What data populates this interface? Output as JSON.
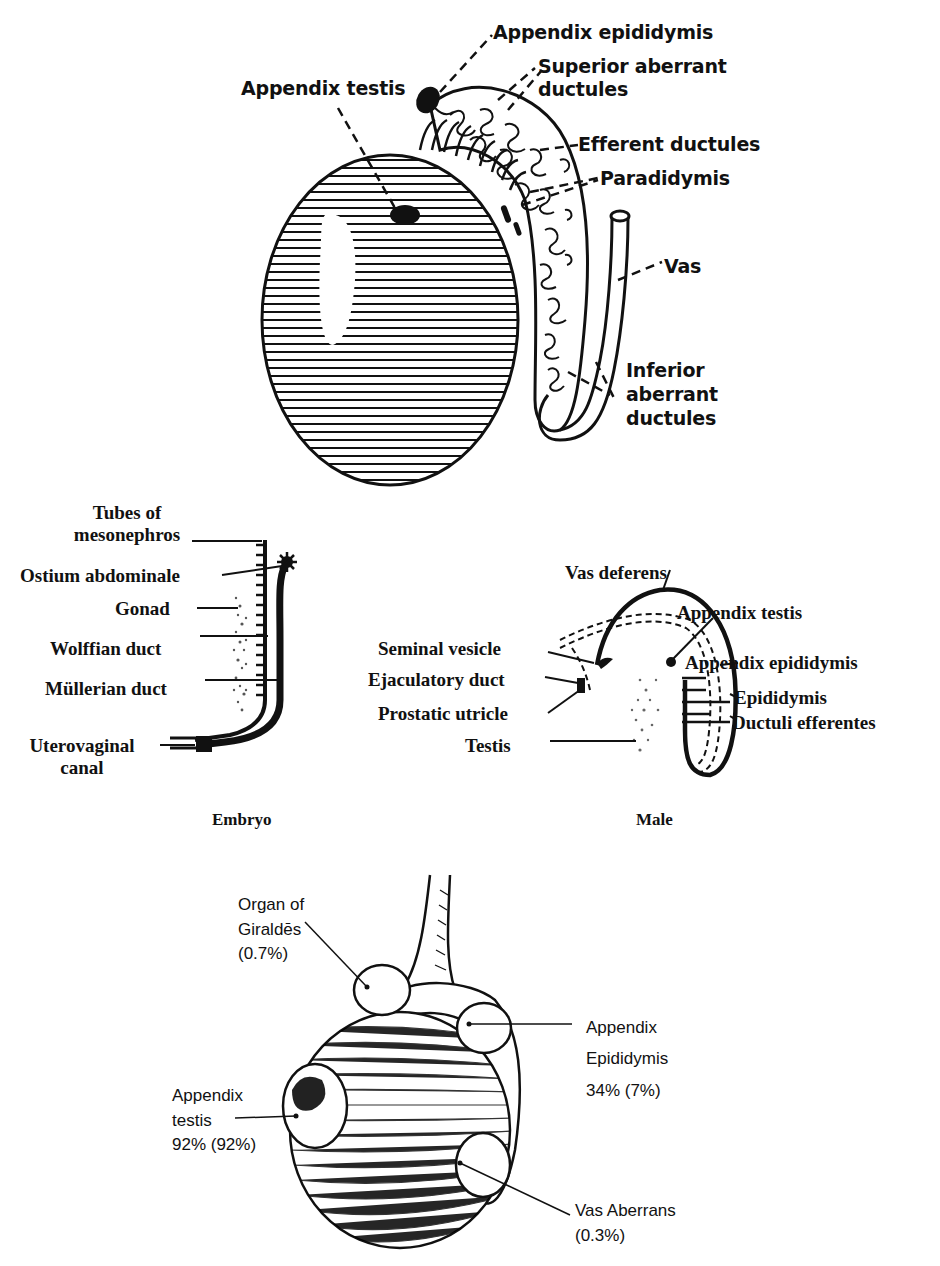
{
  "figure_top": {
    "labels": {
      "appendix_epididymis": "Appendix epididymis",
      "superior_aberrant_1": "Superior aberrant",
      "superior_aberrant_2": "ductules",
      "appendix_testis": "Appendix testis",
      "efferent_ductules": "Efferent ductules",
      "paradidymis": "Paradidymis",
      "vas": "Vas",
      "inferior_aberrant_1": "Inferior",
      "inferior_aberrant_2": "aberrant",
      "inferior_aberrant_3": "ductules"
    }
  },
  "figure_embryo": {
    "caption": "Embryo",
    "labels": {
      "tubes_1": "Tubes of",
      "tubes_2": "mesonephros",
      "ostium": "Ostium abdominale",
      "gonad": "Gonad",
      "wolffian": "Wolffian duct",
      "mullerian": "Müllerian duct",
      "uterovaginal_1": "Uterovaginal",
      "uterovaginal_2": "canal"
    }
  },
  "figure_male": {
    "caption": "Male",
    "labels": {
      "vas_deferens": "Vas deferens",
      "appendix_testis": "Appendix testis",
      "seminal_vesicle": "Seminal vesicle",
      "appendix_epididymis": "Appendix epididymis",
      "ejaculatory_duct": "Ejaculatory duct",
      "epididymis": "Epididymis",
      "prostatic_utricle": "Prostatic utricle",
      "ductuli_efferentes": "Ductuli efferentes",
      "testis": "Testis"
    }
  },
  "figure_bottom": {
    "labels": {
      "giraldes_1": "Organ of",
      "giraldes_2": "Giraldēs",
      "giraldes_pct": "(0.7%)",
      "app_epid_1": "Appendix",
      "app_epid_2": "Epididymis",
      "app_epid_pct": "34% (7%)",
      "app_testis_1": "Appendix",
      "app_testis_2": "testis",
      "app_testis_pct": "92% (92%)",
      "vas_aberrans_1": "Vas Aberrans",
      "vas_aberrans_pct": "(0.3%)"
    }
  }
}
